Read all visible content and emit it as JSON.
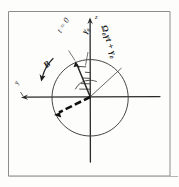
{
  "figure": {
    "kind": "hand-drawn-sketch",
    "frame": {
      "border_color": "#8d8d8d",
      "left": 8,
      "top": 11,
      "right": 170,
      "bottom": 176
    },
    "ink_color": "#222222",
    "thin_ink_color": "#4a4a4a",
    "background": "#fdfdfc"
  },
  "geometry": {
    "origin": {
      "x": 90,
      "y": 97
    },
    "circle_radius": 38,
    "vertical_axis": {
      "x": 90,
      "y_top": 18,
      "y_bottom": 162
    },
    "horizontal_axis": {
      "y": 97,
      "x_left": 22,
      "x_right": 160
    },
    "vector_t0": {
      "angle_deg": 108,
      "length": 40
    },
    "vector_bold": {
      "angle_deg": 203,
      "length": 41
    },
    "radius_line": {
      "angle_deg": 42,
      "length": 40
    },
    "arc_radius": 17
  },
  "labels": {
    "omega_gamma_t": "Ω₀γt + γ₀",
    "t_equals_0": "t = 0",
    "gamma_0": "γ₀",
    "B_field": "B",
    "axis_vertical": "z",
    "axis_horizontal": "y"
  }
}
